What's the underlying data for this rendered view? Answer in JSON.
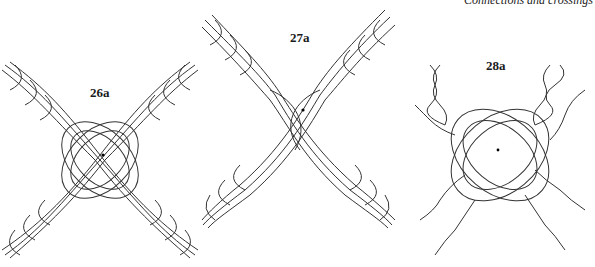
{
  "page": {
    "running_head": "Connections and crossings"
  },
  "figures": [
    {
      "label": "26a",
      "description": "Two four-strand plaits crossing in an X, interlaced at the center with a center dot"
    },
    {
      "label": "27a",
      "description": "Two four-strand plaits crossing in an X, strands split and woven through each other at the center with a center dot"
    },
    {
      "label": "28a",
      "description": "Four two-strand twists per side crossing in an X, with an interlaced lattice at the center and a center dot"
    }
  ]
}
